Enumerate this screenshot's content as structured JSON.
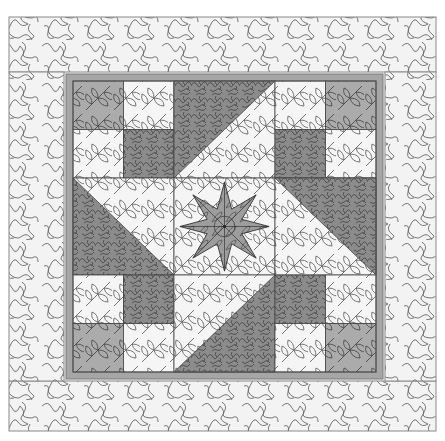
{
  "image": {
    "subject": "quilt-pattern",
    "layout": "3x3 block grid with gray frame and stippled outer border"
  },
  "colors": {
    "background": "#ffffff",
    "border_fill": "#f2f2f2",
    "stitch_line": "#555555",
    "frame": "#a6a6a6",
    "dark_fabric": "#8a8a8a",
    "medium_fabric": "#b2b2b2",
    "light_fabric": "#f4f4f4",
    "star_fabric": "#9c9c9c",
    "seam": "#444444"
  },
  "quilt": {
    "outer": {
      "x": 9,
      "y": 17,
      "w": 427,
      "h": 414
    },
    "frame": {
      "x": 66,
      "y": 74,
      "w": 317,
      "h": 305,
      "thickness": 7
    },
    "blocks_area": {
      "x": 73,
      "y": 81,
      "w": 303,
      "h": 291
    },
    "grid": {
      "rows": 3,
      "cols": 3
    },
    "border_strips": [
      {
        "name": "top",
        "x": 9,
        "y": 17,
        "w": 427,
        "h": 55
      },
      {
        "name": "bottom",
        "x": 9,
        "y": 381,
        "w": 427,
        "h": 50
      },
      {
        "name": "left",
        "x": 9,
        "y": 72,
        "w": 55,
        "h": 309
      },
      {
        "name": "right",
        "x": 385,
        "y": 72,
        "w": 51,
        "h": 309
      }
    ],
    "blocks": [
      {
        "row": 0,
        "col": 0,
        "type": "four-patch",
        "quadrants": [
          "dark-leafpatch",
          "light",
          "light",
          "dark"
        ]
      },
      {
        "row": 0,
        "col": 1,
        "type": "hst",
        "dark": "upper-left",
        "diagonal": "tr-bl"
      },
      {
        "row": 0,
        "col": 2,
        "type": "four-patch",
        "quadrants": [
          "light",
          "dark-leafpatch",
          "dark",
          "light"
        ]
      },
      {
        "row": 1,
        "col": 0,
        "type": "hst",
        "dark": "lower-left",
        "diagonal": "tl-br"
      },
      {
        "row": 1,
        "col": 1,
        "type": "star",
        "points": 8
      },
      {
        "row": 1,
        "col": 2,
        "type": "hst",
        "dark": "upper-right",
        "diagonal": "tl-br"
      },
      {
        "row": 2,
        "col": 0,
        "type": "four-patch",
        "quadrants": [
          "light",
          "dark",
          "dark-leafpatch",
          "light"
        ]
      },
      {
        "row": 2,
        "col": 1,
        "type": "hst",
        "dark": "lower-right",
        "diagonal": "tr-bl"
      },
      {
        "row": 2,
        "col": 2,
        "type": "four-patch",
        "quadrants": [
          "dark",
          "light",
          "light",
          "dark-leafpatch"
        ]
      }
    ]
  }
}
